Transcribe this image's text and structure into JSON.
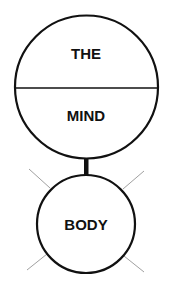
{
  "diagram": {
    "type": "concept-diagram",
    "top_circle": {
      "upper_label": "THE",
      "lower_label": "MIND",
      "divided": true
    },
    "connector": {
      "style": "thick-black-line"
    },
    "bottom_circle": {
      "label": "BODY",
      "rays": 4
    },
    "colors": {
      "stroke": "#111111",
      "ray": "#9a9a9a",
      "text": "#111111",
      "background": "#ffffff"
    }
  }
}
